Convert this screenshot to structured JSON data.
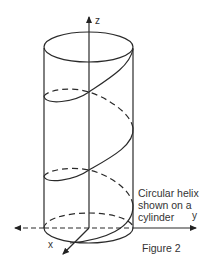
{
  "figure": {
    "caption": "Circular helix\nshown on a\ncylinder",
    "figure_label": "Figure 2",
    "axes": {
      "x": "x",
      "y": "y",
      "z": "z"
    }
  },
  "colors": {
    "stroke": "#2a2a2a",
    "background": "#ffffff",
    "text": "#333333"
  }
}
